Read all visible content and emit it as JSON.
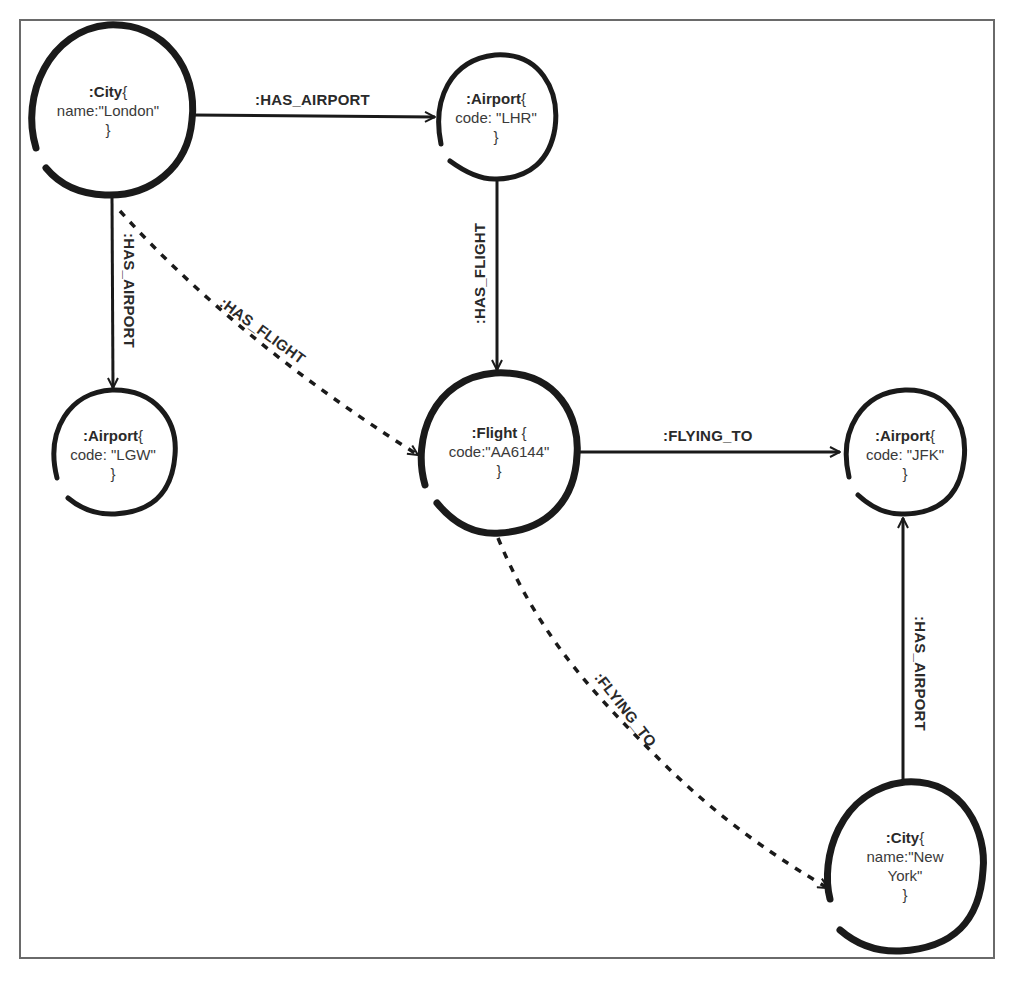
{
  "diagram": {
    "type": "property-graph",
    "nodes": [
      {
        "id": "london",
        "label": ":City",
        "open": "{",
        "prop": "name:\"London\"",
        "close": "}"
      },
      {
        "id": "lhr",
        "label": ":Airport",
        "open": "{",
        "prop": "code: \"LHR\"",
        "close": "}"
      },
      {
        "id": "lgw",
        "label": ":Airport",
        "open": "{",
        "prop": "code: \"LGW\"",
        "close": "}"
      },
      {
        "id": "flight",
        "label": ":Flight",
        "open": " {",
        "prop": "code:\"AA6144\"",
        "close": "}"
      },
      {
        "id": "jfk",
        "label": ":Airport",
        "open": "{",
        "prop": "code: \"JFK\"",
        "close": "}"
      },
      {
        "id": "newyork",
        "label": ":City",
        "open": "{",
        "prop": "name:\"New York\"",
        "close": "}"
      }
    ],
    "edges": [
      {
        "id": "london-lhr",
        "from": "london",
        "to": "lhr",
        "label": ":HAS_AIRPORT",
        "style": "solid"
      },
      {
        "id": "london-lgw",
        "from": "london",
        "to": "lgw",
        "label": ":HAS_AIRPORT",
        "style": "solid"
      },
      {
        "id": "london-flight",
        "from": "london",
        "to": "flight",
        "label": ":HAS_FLIGHT",
        "style": "dashed"
      },
      {
        "id": "lhr-flight",
        "from": "lhr",
        "to": "flight",
        "label": ":HAS_FLIGHT",
        "style": "solid"
      },
      {
        "id": "flight-jfk",
        "from": "flight",
        "to": "jfk",
        "label": ":FLYING_TO",
        "style": "solid"
      },
      {
        "id": "flight-newyork",
        "from": "flight",
        "to": "newyork",
        "label": ":FLYING_TO",
        "style": "dashed"
      },
      {
        "id": "newyork-jfk",
        "from": "newyork",
        "to": "jfk",
        "label": ":HAS_AIRPORT",
        "style": "solid"
      }
    ]
  },
  "colors": {
    "stroke": "#1a1a1a",
    "frame": "#6a6a6a",
    "text": "#3a3a3a"
  }
}
